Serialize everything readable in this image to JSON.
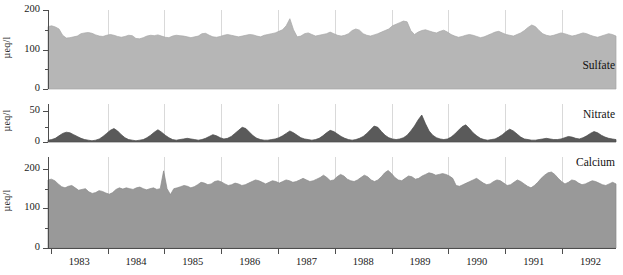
{
  "chart_data": {
    "type": "area",
    "title": "",
    "subtitle": "",
    "xlabel": "",
    "ylabel": "µeq/l",
    "grid": "vertical-only",
    "legend": "inline-panel-labels",
    "x_tick_labels": [
      "1983",
      "1984",
      "1985",
      "1986",
      "1987",
      "1988",
      "1989",
      "1990",
      "1991",
      "1992"
    ],
    "x_range": [
      1982.5,
      1992.9
    ],
    "panels": [
      {
        "name": "Sulfate",
        "label": "Sulfate",
        "ylabel": "µeq/l",
        "ylim": [
          0,
          200
        ],
        "yticks": [
          0,
          100,
          200
        ],
        "ytick_labels": [
          "0",
          "100",
          "200"
        ],
        "fill_color": "#b6b6b6",
        "line_color": "#a8a8a8",
        "values": [
          158,
          160,
          157,
          152,
          136,
          129,
          130,
          132,
          134,
          140,
          142,
          143,
          141,
          137,
          134,
          133,
          136,
          138,
          136,
          133,
          131,
          133,
          136,
          135,
          128,
          127,
          130,
          134,
          136,
          135,
          137,
          134,
          131,
          130,
          134,
          136,
          135,
          134,
          132,
          130,
          132,
          134,
          140,
          141,
          136,
          132,
          131,
          133,
          136,
          138,
          136,
          134,
          132,
          134,
          136,
          138,
          137,
          134,
          132,
          136,
          138,
          140,
          142,
          146,
          150,
          160,
          178,
          150,
          132,
          134,
          140,
          142,
          138,
          134,
          136,
          138,
          140,
          144,
          140,
          136,
          134,
          136,
          140,
          148,
          152,
          149,
          140,
          136,
          134,
          137,
          140,
          144,
          148,
          152,
          160,
          164,
          168,
          172,
          170,
          148,
          138,
          144,
          148,
          150,
          147,
          144,
          142,
          146,
          149,
          144,
          138,
          134,
          131,
          133,
          136,
          138,
          136,
          133,
          130,
          132,
          136,
          140,
          144,
          146,
          142,
          138,
          136,
          134,
          138,
          142,
          148,
          156,
          162,
          158,
          148,
          140,
          136,
          134,
          136,
          139,
          142,
          140,
          137,
          134,
          136,
          139,
          142,
          140,
          136,
          133,
          131,
          134,
          137,
          140,
          138,
          134
        ]
      },
      {
        "name": "Nitrate",
        "label": "Nitrate",
        "ylabel": "µeq/l",
        "ylim": [
          0,
          62
        ],
        "yticks": [
          0,
          50
        ],
        "ytick_labels": [
          "0",
          "50"
        ],
        "fill_color": "#5a5a5a",
        "line_color": "#4a4a4a",
        "values": [
          3,
          4,
          6,
          10,
          14,
          16,
          15,
          12,
          9,
          6,
          4,
          3,
          2,
          3,
          5,
          9,
          14,
          19,
          22,
          18,
          12,
          7,
          4,
          3,
          2,
          3,
          4,
          7,
          11,
          16,
          20,
          16,
          11,
          7,
          4,
          3,
          4,
          5,
          6,
          5,
          4,
          3,
          4,
          6,
          9,
          12,
          10,
          7,
          5,
          6,
          9,
          14,
          19,
          24,
          22,
          16,
          10,
          6,
          4,
          3,
          3,
          4,
          5,
          7,
          10,
          14,
          18,
          15,
          11,
          7,
          5,
          4,
          3,
          4,
          6,
          10,
          15,
          19,
          17,
          13,
          9,
          6,
          4,
          3,
          4,
          6,
          9,
          14,
          20,
          26,
          24,
          17,
          11,
          7,
          5,
          4,
          5,
          7,
          11,
          18,
          26,
          36,
          44,
          30,
          18,
          11,
          7,
          5,
          4,
          5,
          8,
          13,
          19,
          25,
          28,
          22,
          15,
          10,
          6,
          4,
          3,
          4,
          5,
          8,
          12,
          17,
          21,
          18,
          13,
          8,
          5,
          4,
          3,
          3,
          4,
          5,
          6,
          5,
          4,
          4,
          5,
          7,
          9,
          8,
          6,
          5,
          7,
          10,
          14,
          17,
          15,
          11,
          8,
          6,
          5,
          4
        ]
      },
      {
        "name": "Calcium",
        "label": "Calcium",
        "ylabel": "µeq/l",
        "ylim": [
          0,
          230
        ],
        "yticks": [
          0,
          100,
          200
        ],
        "ytick_labels": [
          "0",
          "100",
          "200"
        ],
        "fill_color": "#999999",
        "line_color": "#8a8a8a",
        "values": [
          172,
          174,
          170,
          162,
          155,
          152,
          156,
          158,
          152,
          146,
          148,
          150,
          142,
          138,
          140,
          145,
          143,
          139,
          136,
          140,
          148,
          152,
          149,
          152,
          150,
          148,
          152,
          154,
          150,
          147,
          150,
          152,
          148,
          150,
          195,
          150,
          135,
          150,
          152,
          155,
          158,
          156,
          152,
          155,
          160,
          166,
          164,
          160,
          162,
          168,
          170,
          167,
          162,
          158,
          160,
          164,
          162,
          158,
          160,
          164,
          168,
          172,
          170,
          166,
          162,
          166,
          170,
          168,
          164,
          168,
          172,
          170,
          166,
          168,
          172,
          176,
          172,
          168,
          170,
          174,
          178,
          184,
          178,
          170,
          172,
          180,
          186,
          182,
          174,
          170,
          168,
          172,
          178,
          184,
          180,
          172,
          168,
          172,
          180,
          190,
          196,
          188,
          178,
          172,
          170,
          176,
          182,
          180,
          174,
          176,
          182,
          186,
          190,
          188,
          184,
          186,
          188,
          186,
          182,
          176,
          158,
          156,
          160,
          164,
          168,
          172,
          176,
          170,
          164,
          160,
          162,
          168,
          172,
          170,
          164,
          158,
          160,
          166,
          172,
          168,
          162,
          156,
          152,
          158,
          166,
          176,
          184,
          190,
          192,
          186,
          176,
          168,
          162,
          166,
          172,
          170,
          164,
          160,
          162,
          166,
          170,
          168,
          164,
          160,
          158,
          162,
          166,
          162
        ]
      }
    ]
  }
}
